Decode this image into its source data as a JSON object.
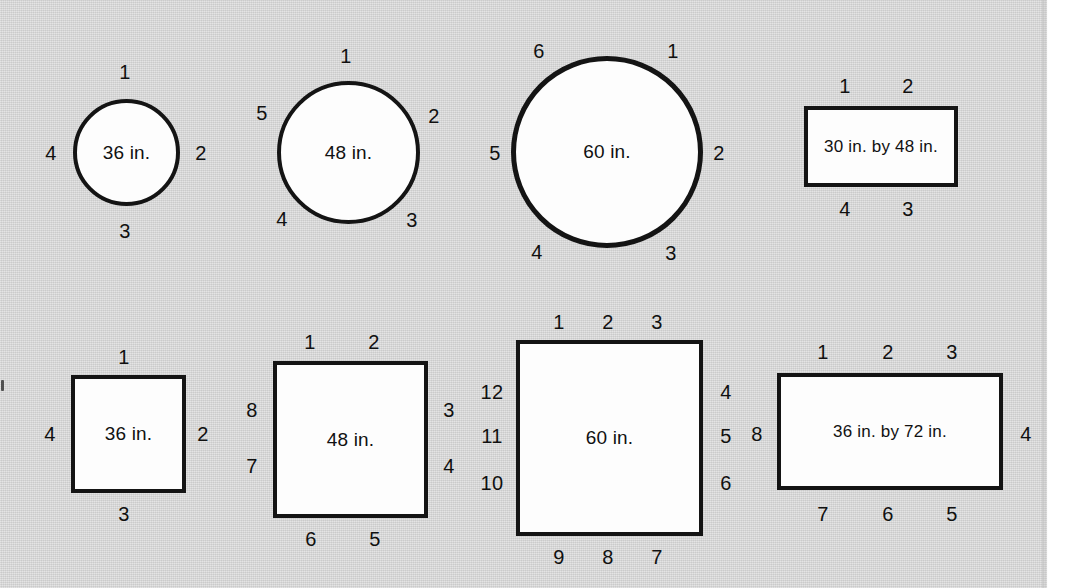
{
  "page": {
    "background_color": "#d3d3d3",
    "shape_fill": "#fdfdfd",
    "shape_stroke": "#141414",
    "margin_speck": "scanner-artifact"
  },
  "figures": [
    {
      "id": "round-36",
      "kind": "circle",
      "caption": "36 in.",
      "seat_count": 4,
      "seats": [
        {
          "label": "1",
          "x": 125,
          "y": 72
        },
        {
          "label": "2",
          "x": 201,
          "y": 153
        },
        {
          "label": "3",
          "x": 125,
          "y": 231
        },
        {
          "label": "4",
          "x": 51,
          "y": 153
        }
      ],
      "box": {
        "left": 73,
        "top": 99,
        "width": 107,
        "height": 107
      }
    },
    {
      "id": "round-48",
      "kind": "circle",
      "caption": "48 in.",
      "seat_count": 5,
      "seats": [
        {
          "label": "1",
          "x": 346,
          "y": 56
        },
        {
          "label": "2",
          "x": 434,
          "y": 116
        },
        {
          "label": "3",
          "x": 412,
          "y": 220
        },
        {
          "label": "4",
          "x": 282,
          "y": 219
        },
        {
          "label": "5",
          "x": 262,
          "y": 113
        }
      ],
      "box": {
        "left": 277,
        "top": 81,
        "width": 143,
        "height": 143
      }
    },
    {
      "id": "round-60",
      "kind": "circle",
      "caption": "60 in.",
      "seat_count": 6,
      "seats": [
        {
          "label": "1",
          "x": 673,
          "y": 51
        },
        {
          "label": "2",
          "x": 719,
          "y": 153
        },
        {
          "label": "3",
          "x": 671,
          "y": 253
        },
        {
          "label": "4",
          "x": 537,
          "y": 252
        },
        {
          "label": "5",
          "x": 495,
          "y": 153
        },
        {
          "label": "6",
          "x": 539,
          "y": 51
        }
      ],
      "box": {
        "left": 511,
        "top": 56,
        "width": 192,
        "height": 192
      }
    },
    {
      "id": "rect-30x48",
      "kind": "rect",
      "caption": "30 in. by 48 in.",
      "seat_count": 4,
      "seats": [
        {
          "label": "1",
          "x": 845,
          "y": 86
        },
        {
          "label": "2",
          "x": 908,
          "y": 86
        },
        {
          "label": "3",
          "x": 908,
          "y": 209
        },
        {
          "label": "4",
          "x": 845,
          "y": 209
        }
      ],
      "box": {
        "left": 804,
        "top": 106,
        "width": 154,
        "height": 81
      }
    },
    {
      "id": "square-36",
      "kind": "rect",
      "caption": "36 in.",
      "seat_count": 4,
      "seats": [
        {
          "label": "1",
          "x": 124,
          "y": 357
        },
        {
          "label": "2",
          "x": 203,
          "y": 434
        },
        {
          "label": "3",
          "x": 124,
          "y": 514
        },
        {
          "label": "4",
          "x": 50,
          "y": 434
        }
      ],
      "box": {
        "left": 71,
        "top": 375,
        "width": 115,
        "height": 118
      }
    },
    {
      "id": "square-48",
      "kind": "rect",
      "caption": "48 in.",
      "seat_count": 8,
      "seats": [
        {
          "label": "1",
          "x": 310,
          "y": 342
        },
        {
          "label": "2",
          "x": 374,
          "y": 342
        },
        {
          "label": "3",
          "x": 449,
          "y": 410
        },
        {
          "label": "4",
          "x": 449,
          "y": 466
        },
        {
          "label": "5",
          "x": 375,
          "y": 539
        },
        {
          "label": "6",
          "x": 311,
          "y": 539
        },
        {
          "label": "7",
          "x": 252,
          "y": 466
        },
        {
          "label": "8",
          "x": 252,
          "y": 410
        }
      ],
      "box": {
        "left": 273,
        "top": 361,
        "width": 155,
        "height": 157
      }
    },
    {
      "id": "square-60",
      "kind": "rect",
      "caption": "60 in.",
      "seat_count": 12,
      "seats": [
        {
          "label": "1",
          "x": 559,
          "y": 322
        },
        {
          "label": "2",
          "x": 608,
          "y": 322
        },
        {
          "label": "3",
          "x": 657,
          "y": 322
        },
        {
          "label": "4",
          "x": 726,
          "y": 392
        },
        {
          "label": "5",
          "x": 726,
          "y": 436
        },
        {
          "label": "6",
          "x": 726,
          "y": 483
        },
        {
          "label": "7",
          "x": 657,
          "y": 557
        },
        {
          "label": "8",
          "x": 608,
          "y": 557
        },
        {
          "label": "9",
          "x": 559,
          "y": 557
        },
        {
          "label": "10",
          "x": 492,
          "y": 483
        },
        {
          "label": "11",
          "x": 492,
          "y": 436
        },
        {
          "label": "12",
          "x": 492,
          "y": 392
        }
      ],
      "box": {
        "left": 516,
        "top": 340,
        "width": 187,
        "height": 196
      }
    },
    {
      "id": "rect-36x72",
      "kind": "rect",
      "caption": "36 in. by 72 in.",
      "seat_count": 8,
      "seats": [
        {
          "label": "1",
          "x": 823,
          "y": 352
        },
        {
          "label": "2",
          "x": 888,
          "y": 352
        },
        {
          "label": "3",
          "x": 952,
          "y": 352
        },
        {
          "label": "4",
          "x": 1026,
          "y": 434
        },
        {
          "label": "5",
          "x": 952,
          "y": 514
        },
        {
          "label": "6",
          "x": 888,
          "y": 514
        },
        {
          "label": "7",
          "x": 823,
          "y": 514
        },
        {
          "label": "8",
          "x": 757,
          "y": 434
        }
      ],
      "box": {
        "left": 777,
        "top": 373,
        "width": 226,
        "height": 117
      }
    }
  ]
}
